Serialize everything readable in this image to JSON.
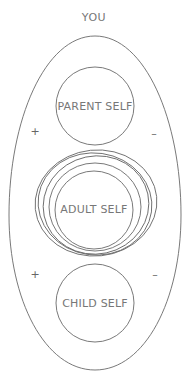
{
  "diagram": {
    "title": "YOU",
    "outer_shape": "oval",
    "nodes": [
      {
        "id": "parent",
        "label": "PARENT SELF"
      },
      {
        "id": "adult",
        "label": "ADULT SELF",
        "emphasis": "multiple concentric outlines"
      },
      {
        "id": "child",
        "label": "CHILD SELF"
      }
    ],
    "signs": {
      "upper_left": "+",
      "upper_right": "–",
      "lower_left": "+",
      "lower_right": "–"
    },
    "colors": {
      "stroke": "#6a6a6a",
      "text": "#777777",
      "background": "#ffffff"
    }
  }
}
